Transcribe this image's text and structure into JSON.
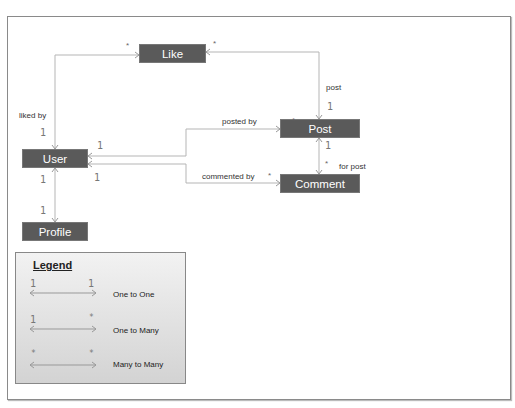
{
  "diagram": {
    "entities": {
      "like": "Like",
      "user": "User",
      "post": "Post",
      "comment": "Comment",
      "profile": "Profile"
    },
    "relations": {
      "liked_by": "liked by",
      "post": "post",
      "posted_by": "posted by",
      "commented_by": "commented by",
      "for_post": "for post"
    },
    "multiplicities": {
      "one": "1",
      "many": "*"
    },
    "legend": {
      "title": "Legend",
      "rows": [
        {
          "left": "1",
          "right": "1",
          "label": "One to One"
        },
        {
          "left": "1",
          "right": "*",
          "label": "One to Many"
        },
        {
          "left": "*",
          "right": "*",
          "label": "Many to Many"
        }
      ]
    },
    "colors": {
      "entity_fill": "#5a5a5a",
      "connector": "#b0b0b0"
    }
  }
}
